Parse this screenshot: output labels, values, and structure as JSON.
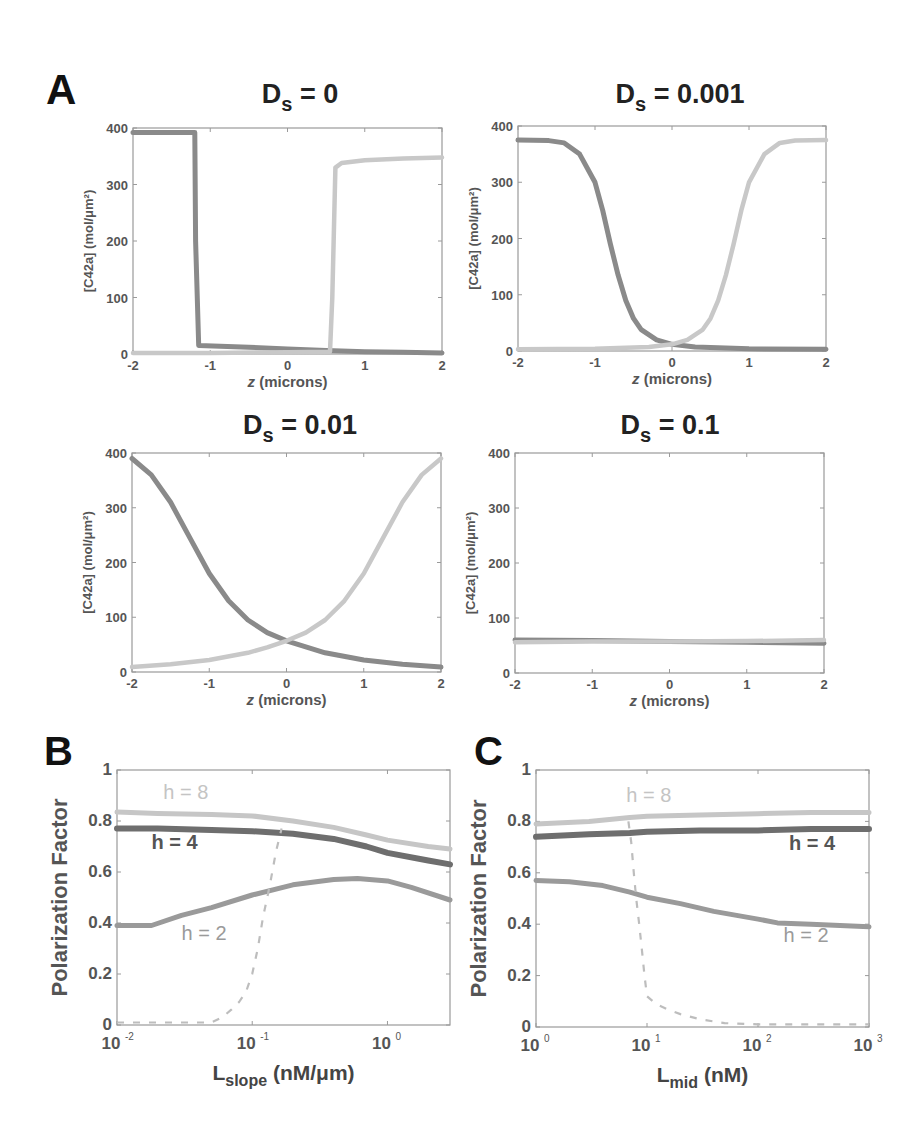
{
  "figure": {
    "panel_labels": {
      "A": "A",
      "B": "B",
      "C": "C"
    },
    "colors": {
      "dark_curve": "#8a8a8a",
      "light_curve": "#c8c8c8",
      "h4_curve": "#6e6e6e",
      "h2_curve": "#9a9a9a",
      "h8_curve": "#c6c6c6",
      "dashed_curve": "#bdbdbd",
      "axis": "#9a9a9a",
      "tick_label": "#555555",
      "title": "#222222"
    }
  },
  "chart_data": [
    {
      "id": "A1",
      "type": "line",
      "title": "Ds = 0",
      "title_main": "D",
      "title_sub": "s",
      "title_rest": " = 0",
      "xlabel": "z (microns)",
      "ylabel": "[C42a] (mol/μm²)",
      "xlim": [
        -2,
        2
      ],
      "ylim": [
        0,
        400
      ],
      "xticks": [
        -2,
        -1,
        0,
        1,
        2
      ],
      "yticks": [
        0,
        100,
        200,
        300,
        400
      ],
      "grid": false,
      "series": [
        {
          "name": "dark",
          "x": [
            -2,
            -1.2,
            -1.19,
            -1.15,
            -0.5,
            0,
            0.5,
            1,
            1.5,
            2
          ],
          "y": [
            392,
            392,
            200,
            15,
            12,
            9,
            6,
            4,
            3,
            2
          ]
        },
        {
          "name": "light",
          "x": [
            -2,
            -1,
            0,
            0.55,
            0.58,
            0.62,
            0.7,
            1,
            1.5,
            2
          ],
          "y": [
            2,
            2,
            3,
            4,
            100,
            330,
            338,
            343,
            346,
            348
          ]
        }
      ]
    },
    {
      "id": "A2",
      "type": "line",
      "title": "Ds = 0.001",
      "title_main": "D",
      "title_sub": "s",
      "title_rest": " = 0.001",
      "xlabel": "z (microns)",
      "ylabel": "[C42a] (mol/μm²)",
      "xlim": [
        -2,
        2
      ],
      "ylim": [
        0,
        400
      ],
      "xticks": [
        -2,
        -1,
        0,
        1,
        2
      ],
      "yticks": [
        0,
        100,
        200,
        300,
        400
      ],
      "grid": false,
      "series": [
        {
          "name": "dark",
          "x": [
            -2,
            -1.6,
            -1.4,
            -1.2,
            -1.0,
            -0.9,
            -0.8,
            -0.7,
            -0.6,
            -0.5,
            -0.4,
            -0.2,
            0,
            0.3,
            1,
            2
          ],
          "y": [
            375,
            374,
            370,
            350,
            300,
            250,
            190,
            135,
            90,
            58,
            38,
            20,
            12,
            7,
            4,
            3
          ]
        },
        {
          "name": "light",
          "x": [
            -2,
            -1,
            -0.3,
            0,
            0.2,
            0.4,
            0.5,
            0.6,
            0.7,
            0.8,
            0.9,
            1.0,
            1.2,
            1.4,
            1.6,
            2
          ],
          "y": [
            3,
            4,
            7,
            12,
            20,
            38,
            58,
            90,
            135,
            190,
            250,
            300,
            350,
            370,
            374,
            375
          ]
        }
      ]
    },
    {
      "id": "A3",
      "type": "line",
      "title": "Ds = 0.01",
      "title_main": "D",
      "title_sub": "s",
      "title_rest": " = 0.01",
      "xlabel": "z (microns)",
      "ylabel": "[C42a] (mol/μm²)",
      "xlim": [
        -2,
        2
      ],
      "ylim": [
        0,
        400
      ],
      "xticks": [
        -2,
        -1,
        0,
        1,
        2
      ],
      "yticks": [
        0,
        100,
        200,
        300,
        400
      ],
      "grid": false,
      "series": [
        {
          "name": "dark",
          "x": [
            -2,
            -1.75,
            -1.5,
            -1.25,
            -1,
            -0.75,
            -0.5,
            -0.25,
            0,
            0.5,
            1,
            1.5,
            2
          ],
          "y": [
            390,
            360,
            310,
            245,
            180,
            130,
            95,
            72,
            57,
            35,
            22,
            14,
            9
          ]
        },
        {
          "name": "light",
          "x": [
            -2,
            -1.5,
            -1,
            -0.5,
            -0.25,
            0,
            0.25,
            0.5,
            0.75,
            1,
            1.25,
            1.5,
            1.75,
            2
          ],
          "y": [
            9,
            14,
            22,
            35,
            45,
            57,
            72,
            95,
            130,
            180,
            245,
            310,
            360,
            390
          ]
        }
      ]
    },
    {
      "id": "A4",
      "type": "line",
      "title": "Ds = 0.1",
      "title_main": "D",
      "title_sub": "s",
      "title_rest": " = 0.1",
      "xlabel": "z (microns)",
      "ylabel": "[C42a] (mol/μm²)",
      "xlim": [
        -2,
        2
      ],
      "ylim": [
        0,
        400
      ],
      "xticks": [
        -2,
        -1,
        0,
        1,
        2
      ],
      "yticks": [
        0,
        100,
        200,
        300,
        400
      ],
      "grid": false,
      "series": [
        {
          "name": "dark",
          "x": [
            -2,
            -1,
            0,
            1,
            2
          ],
          "y": [
            60,
            59,
            57,
            56,
            54
          ]
        },
        {
          "name": "light",
          "x": [
            -2,
            -1,
            0,
            1,
            2
          ],
          "y": [
            56,
            57,
            57,
            58,
            60
          ]
        }
      ]
    },
    {
      "id": "B",
      "type": "line",
      "xscale": "log",
      "title": "",
      "xlabel": "Lslope (nM/μm)",
      "xlabel_main": "L",
      "xlabel_sub": "slope",
      "xlabel_rest": "  (nM/μm)",
      "ylabel": "Polarization Factor",
      "xlim": [
        0.01,
        2.9
      ],
      "ylim": [
        0,
        1
      ],
      "xticks": [
        0.01,
        0.1,
        1
      ],
      "xtick_labels": [
        {
          "base": "10",
          "exp": "-2"
        },
        {
          "base": "10",
          "exp": "-1"
        },
        {
          "base": "10",
          "exp": "0"
        }
      ],
      "yticks": [
        0,
        0.2,
        0.4,
        0.6,
        0.8,
        1
      ],
      "ytick_labels": [
        "0",
        "0.2",
        "0.4",
        "0.6",
        "0.8",
        "1"
      ],
      "grid": false,
      "series": [
        {
          "name": "h = 8",
          "x": [
            0.01,
            0.02,
            0.05,
            0.1,
            0.2,
            0.4,
            0.7,
            1,
            2,
            2.9
          ],
          "y": [
            0.835,
            0.83,
            0.825,
            0.82,
            0.8,
            0.775,
            0.745,
            0.725,
            0.7,
            0.69
          ]
        },
        {
          "name": "h = 4",
          "x": [
            0.01,
            0.02,
            0.05,
            0.1,
            0.2,
            0.4,
            0.7,
            1,
            2,
            2.9
          ],
          "y": [
            0.77,
            0.77,
            0.765,
            0.76,
            0.75,
            0.73,
            0.7,
            0.675,
            0.645,
            0.63
          ]
        },
        {
          "name": "h = 2",
          "x": [
            0.01,
            0.018,
            0.03,
            0.05,
            0.1,
            0.2,
            0.4,
            0.6,
            1,
            1.5,
            2.9
          ],
          "y": [
            0.39,
            0.39,
            0.43,
            0.46,
            0.51,
            0.55,
            0.57,
            0.575,
            0.565,
            0.54,
            0.49
          ]
        },
        {
          "name": "threshold (dashed)",
          "dashed": true,
          "x": [
            0.01,
            0.03,
            0.05,
            0.06,
            0.07,
            0.08,
            0.09,
            0.1,
            0.11,
            0.12,
            0.135,
            0.15,
            0.165
          ],
          "y": [
            0.01,
            0.01,
            0.01,
            0.03,
            0.06,
            0.09,
            0.13,
            0.2,
            0.3,
            0.42,
            0.55,
            0.68,
            0.77
          ]
        }
      ],
      "annotations": [
        {
          "text": "h = 8",
          "x": 0.022,
          "y": 0.885,
          "series": "h = 8"
        },
        {
          "text": "h = 4",
          "x": 0.018,
          "y": 0.69,
          "series": "h = 4"
        },
        {
          "text": "h = 2",
          "x": 0.03,
          "y": 0.335,
          "series": "h = 2"
        }
      ]
    },
    {
      "id": "C",
      "type": "line",
      "xscale": "log",
      "title": "",
      "xlabel": "Lmid (nM)",
      "xlabel_main": "L",
      "xlabel_sub": "mid",
      "xlabel_rest": "  (nM)",
      "ylabel": "Polarization Factor",
      "xlim": [
        1,
        1000
      ],
      "ylim": [
        0,
        1
      ],
      "xticks": [
        1,
        10,
        100,
        1000
      ],
      "xtick_labels": [
        {
          "base": "10",
          "exp": "0"
        },
        {
          "base": "10",
          "exp": "1"
        },
        {
          "base": "10",
          "exp": "2"
        },
        {
          "base": "10",
          "exp": "3"
        }
      ],
      "yticks": [
        0,
        0.2,
        0.4,
        0.6,
        0.8,
        1
      ],
      "ytick_labels": [
        "0",
        "0.2",
        "0.4",
        "0.6",
        "0.8",
        "1"
      ],
      "grid": false,
      "series": [
        {
          "name": "h = 8",
          "x": [
            1,
            3,
            7,
            10,
            30,
            100,
            300,
            1000
          ],
          "y": [
            0.79,
            0.8,
            0.815,
            0.82,
            0.825,
            0.83,
            0.835,
            0.835
          ]
        },
        {
          "name": "h = 4",
          "x": [
            1,
            3,
            7,
            10,
            30,
            100,
            300,
            1000
          ],
          "y": [
            0.74,
            0.75,
            0.755,
            0.76,
            0.765,
            0.765,
            0.77,
            0.77
          ]
        },
        {
          "name": "h = 2",
          "x": [
            1,
            2,
            4,
            7,
            10,
            20,
            40,
            100,
            150,
            300,
            1000
          ],
          "y": [
            0.57,
            0.565,
            0.55,
            0.525,
            0.505,
            0.48,
            0.45,
            0.42,
            0.405,
            0.4,
            0.39
          ]
        },
        {
          "name": "threshold (dashed)",
          "dashed": true,
          "x": [
            6.8,
            7.2,
            7.6,
            8.0,
            8.5,
            9.0,
            9.5,
            10,
            12,
            15,
            20,
            30,
            50,
            100,
            1000
          ],
          "y": [
            0.8,
            0.72,
            0.6,
            0.5,
            0.4,
            0.3,
            0.2,
            0.12,
            0.09,
            0.07,
            0.05,
            0.03,
            0.015,
            0.01,
            0.01
          ]
        }
      ],
      "annotations": [
        {
          "text": "h = 8",
          "x": 6.5,
          "y": 0.875,
          "series": "h = 8"
        },
        {
          "text": "h = 4",
          "x": 190,
          "y": 0.69,
          "series": "h = 4"
        },
        {
          "text": "h = 2",
          "x": 170,
          "y": 0.33,
          "series": "h = 2"
        }
      ]
    }
  ]
}
